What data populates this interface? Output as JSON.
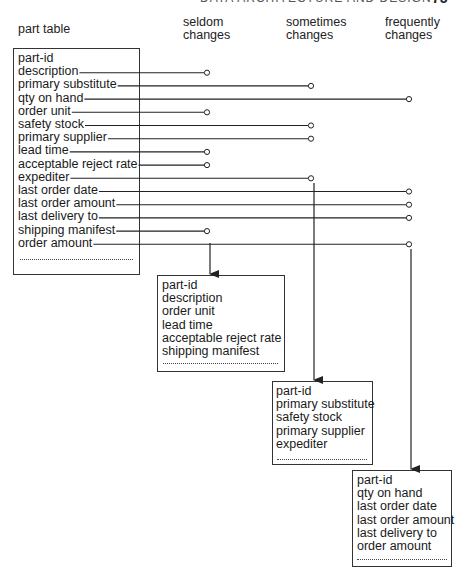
{
  "page": {
    "running_head": "DATA ARCHITECTURE AND DESIGN",
    "page_number": "75"
  },
  "headers": {
    "part_table": "part table",
    "seldom": [
      "seldom",
      "changes"
    ],
    "sometimes": [
      "sometimes",
      "changes"
    ],
    "frequently": [
      "frequently",
      "changes"
    ]
  },
  "part_table": {
    "fields": [
      "part-id",
      "description",
      "primary substitute",
      "qty on hand",
      "order unit",
      "safety stock",
      "primary supplier",
      "lead time",
      "acceptable reject rate",
      "expediter",
      "last order date",
      "last order amount",
      "last delivery to",
      "shipping manifest",
      "order amount"
    ],
    "classification": [
      "key",
      "seldom",
      "sometimes",
      "frequently",
      "seldom",
      "sometimes",
      "sometimes",
      "seldom",
      "seldom",
      "sometimes",
      "frequently",
      "frequently",
      "frequently",
      "seldom",
      "frequently"
    ]
  },
  "seldom_table": {
    "fields": [
      "part-id",
      "description",
      "order unit",
      "lead time",
      "acceptable reject rate",
      "shipping manifest"
    ]
  },
  "sometimes_table": {
    "fields": [
      "part-id",
      "primary substitute",
      "safety stock",
      "primary supplier",
      "expediter"
    ]
  },
  "frequently_table": {
    "fields": [
      "part-id",
      "qty on hand",
      "last order date",
      "last order amount",
      "last delivery to",
      "order amount"
    ]
  },
  "colors": {
    "line": "#222222",
    "text": "#1a1a1a"
  }
}
